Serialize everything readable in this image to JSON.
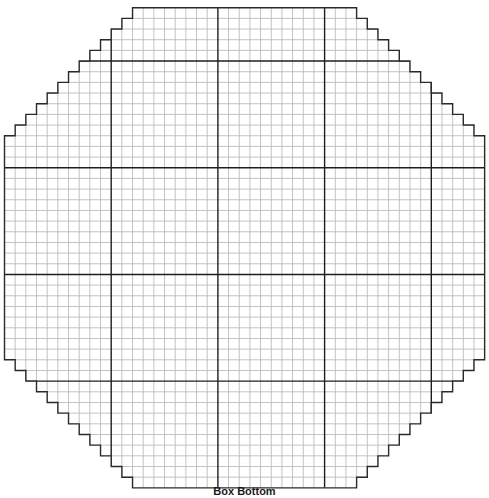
{
  "diagram": {
    "caption": "Box Bottom",
    "grid": {
      "cols": 45,
      "rows": 45,
      "cell_size": 10.67,
      "origin_x": 4.5,
      "origin_y": 7.7,
      "major_every": 10,
      "major_col_offset": 10,
      "major_row_offset": 5,
      "corner_step_cells": 12
    },
    "colors": {
      "minor_line": "#b4b4b4",
      "major_line": "#1e1e1e",
      "outline": "#2a2a2a",
      "background": "#ffffff"
    }
  }
}
